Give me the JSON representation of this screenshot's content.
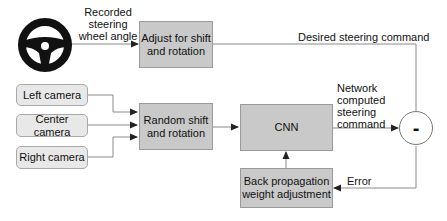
{
  "diagram": {
    "nodes": {
      "steering_wheel": {
        "icon": "steering-wheel-icon"
      },
      "adjust": {
        "label_line1": "Adjust for shift",
        "label_line2": "and rotation"
      },
      "left_camera": {
        "label": "Left camera"
      },
      "center_camera": {
        "label": "Center camera"
      },
      "right_camera": {
        "label": "Right camera"
      },
      "random_shift": {
        "label_line1": "Random shift",
        "label_line2": "and rotation"
      },
      "cnn": {
        "label": "CNN"
      },
      "backprop": {
        "label_line1": "Back propagation",
        "label_line2": "weight adjustment"
      },
      "subtract": {
        "symbol": "-"
      }
    },
    "edge_labels": {
      "recorded_line1": "Recorded",
      "recorded_line2": "steering",
      "recorded_line3": "wheel angle",
      "desired": "Desired steering command",
      "network_line1": "Network",
      "network_line2": "computed",
      "network_line3": "steering",
      "network_line4": "command",
      "error": "Error"
    },
    "edges": [
      {
        "from": "steering_wheel",
        "to": "adjust",
        "label": "Recorded steering wheel angle"
      },
      {
        "from": "adjust",
        "to": "subtract",
        "label": "Desired steering command"
      },
      {
        "from": "left_camera",
        "to": "random_shift"
      },
      {
        "from": "center_camera",
        "to": "random_shift"
      },
      {
        "from": "right_camera",
        "to": "random_shift"
      },
      {
        "from": "random_shift",
        "to": "cnn"
      },
      {
        "from": "cnn",
        "to": "subtract",
        "label": "Network computed steering command"
      },
      {
        "from": "subtract",
        "to": "backprop",
        "label": "Error"
      },
      {
        "from": "backprop",
        "to": "cnn"
      }
    ]
  }
}
